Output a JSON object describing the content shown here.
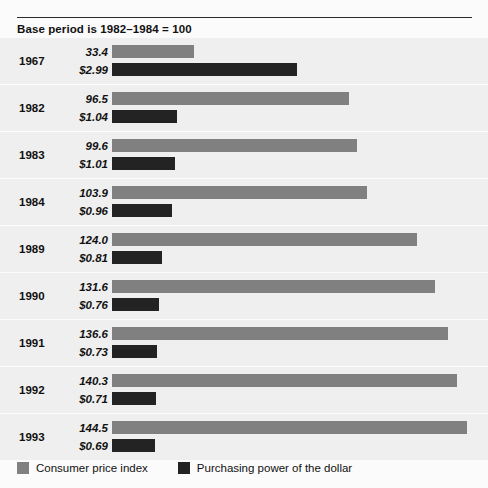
{
  "subtitle": "Base period is 1982–1984 = 100",
  "legend": {
    "items": [
      {
        "label": "Consumer price index",
        "color": "#808080",
        "swatch_name": "legend-swatch-cpi"
      },
      {
        "label": "Purchasing power of the dollar",
        "color": "#232323",
        "swatch_name": "legend-swatch-ppd"
      }
    ]
  },
  "scale": {
    "bar_origin_px": 112,
    "cpi_px_per_unit": 2.456,
    "ppd_px_per_dollar": 62.0
  },
  "rows": [
    {
      "year": "1967",
      "cpi_label": "33.4",
      "ppd_label": "$2.99",
      "cpi": 33.4,
      "ppd": 2.99
    },
    {
      "year": "1982",
      "cpi_label": "96.5",
      "ppd_label": "$1.04",
      "cpi": 96.5,
      "ppd": 1.04
    },
    {
      "year": "1983",
      "cpi_label": "99.6",
      "ppd_label": "$1.01",
      "cpi": 99.6,
      "ppd": 1.01
    },
    {
      "year": "1984",
      "cpi_label": "103.9",
      "ppd_label": "$0.96",
      "cpi": 103.9,
      "ppd": 0.96
    },
    {
      "year": "1989",
      "cpi_label": "124.0",
      "ppd_label": "$0.81",
      "cpi": 124.0,
      "ppd": 0.81
    },
    {
      "year": "1990",
      "cpi_label": "131.6",
      "ppd_label": "$0.76",
      "cpi": 131.6,
      "ppd": 0.76
    },
    {
      "year": "1991",
      "cpi_label": "136.6",
      "ppd_label": "$0.73",
      "cpi": 136.6,
      "ppd": 0.73
    },
    {
      "year": "1992",
      "cpi_label": "140.3",
      "ppd_label": "$0.71",
      "cpi": 140.3,
      "ppd": 0.71
    },
    {
      "year": "1993",
      "cpi_label": "144.5",
      "ppd_label": "$0.69",
      "cpi": 144.5,
      "ppd": 0.69
    }
  ],
  "chart_data": {
    "type": "bar",
    "title": "",
    "subtitle": "Base period is 1982–1984 = 100",
    "orientation": "horizontal",
    "categories": [
      "1967",
      "1982",
      "1983",
      "1984",
      "1989",
      "1990",
      "1991",
      "1992",
      "1993"
    ],
    "series": [
      {
        "name": "Consumer price index",
        "color": "#808080",
        "unit": "index (1982-1984 = 100)",
        "values": [
          33.4,
          96.5,
          99.6,
          103.9,
          124.0,
          131.6,
          136.6,
          140.3,
          144.5
        ],
        "data_labels": [
          "33.4",
          "96.5",
          "99.6",
          "103.9",
          "124.0",
          "131.6",
          "136.6",
          "140.3",
          "144.5"
        ]
      },
      {
        "name": "Purchasing power of the dollar",
        "color": "#232323",
        "unit": "dollars",
        "values": [
          2.99,
          1.04,
          1.01,
          0.96,
          0.81,
          0.76,
          0.73,
          0.71,
          0.69
        ],
        "data_labels": [
          "$2.99",
          "$1.04",
          "$1.01",
          "$0.96",
          "$0.81",
          "$0.76",
          "$0.73",
          "$0.71",
          "$0.69"
        ]
      }
    ],
    "xlabel": "",
    "ylabel": "Year",
    "grid": false,
    "legend_position": "bottom-left"
  }
}
